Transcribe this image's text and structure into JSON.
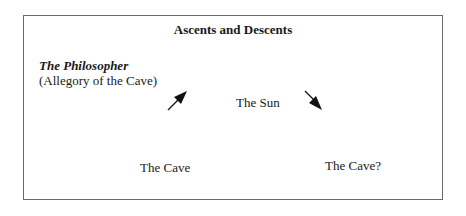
{
  "diagram": {
    "title": "Ascents and Descents",
    "subject": {
      "name": "The Philosopher",
      "subtitle": "(Allegory of the Cave)"
    },
    "nodes": {
      "start": "The Cave",
      "summit": "The Sun",
      "end": "The Cave?"
    },
    "edges": [
      {
        "from": "The Cave",
        "to": "The Sun",
        "direction": "ascent",
        "icon": "arrow-up-right"
      },
      {
        "from": "The Sun",
        "to": "The Cave?",
        "direction": "descent",
        "icon": "arrow-down-right"
      }
    ]
  }
}
